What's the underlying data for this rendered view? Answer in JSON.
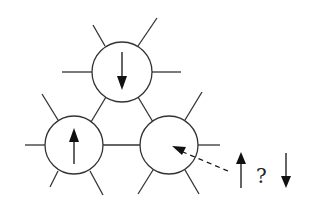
{
  "diagram": {
    "colors": {
      "line": "#333333",
      "fill": "#ffffff",
      "arrow": "#111111"
    },
    "sites": [
      {
        "id": "top",
        "cx": 122,
        "cy": 72,
        "r": 30,
        "spin": "down"
      },
      {
        "id": "left",
        "cx": 74,
        "cy": 145,
        "r": 29,
        "spin": "up"
      },
      {
        "id": "right",
        "cx": 169,
        "cy": 145,
        "r": 29,
        "spin": "undetermined"
      }
    ],
    "legend": {
      "question_mark": "?",
      "options": [
        "up",
        "down"
      ]
    }
  }
}
